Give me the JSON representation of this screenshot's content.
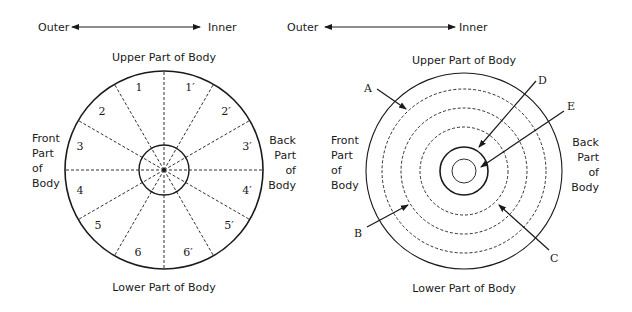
{
  "colors": {
    "ink": "#1a1a1a",
    "background": "#ffffff"
  },
  "left_diagram": {
    "axis": {
      "left_label": "Outer",
      "right_label": "Inner"
    },
    "top_label": "Upper Part of Body",
    "bottom_label": "Lower Part of Body",
    "left_side_label": [
      "Front",
      "Part",
      "of",
      "Body"
    ],
    "right_side_label": [
      "Back",
      "Part",
      "of",
      "Body"
    ],
    "segments_left": [
      "1",
      "2",
      "3",
      "4",
      "5",
      "6"
    ],
    "segments_right": [
      "1′",
      "2′",
      "3′",
      "4′",
      "5′",
      "6′"
    ]
  },
  "right_diagram": {
    "axis": {
      "left_label": "Outer",
      "right_label": "Inner"
    },
    "top_label": "Upper Part of Body",
    "bottom_label": "Lower Part of Body",
    "left_side_label": [
      "Front",
      "Part",
      "of",
      "Body"
    ],
    "right_side_label": [
      "Back",
      "Part",
      "of",
      "Body"
    ],
    "pointers": {
      "a": "A",
      "b": "B",
      "c": "C",
      "d": "D",
      "e": "E"
    }
  }
}
